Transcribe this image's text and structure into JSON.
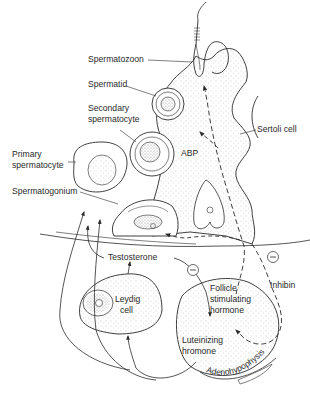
{
  "diagram": {
    "type": "biology-schematic",
    "colors": {
      "line": "#2a2a2a",
      "stipple": "#9a9a9a",
      "background": "#ffffff"
    },
    "labels": {
      "spermatozoon": "Spermatozoon",
      "spermatid": "Spermatid",
      "secondary_spermatocyte_1": "Secondary",
      "secondary_spermatocyte_2": "spermatocyte",
      "primary_spermatocyte_1": "Primary",
      "primary_spermatocyte_2": "spermatocyte",
      "spermatogonium": "Spermatogonium",
      "sertoli_cell": "Sertoli cell",
      "abp": "ABP",
      "testosterone": "Testosterone",
      "leydig_cell_1": "Leydig",
      "leydig_cell_2": "cell",
      "fsh_1": "Follicle",
      "fsh_2": "stimulating",
      "fsh_3": "hormone",
      "lh_1": "Luteinizing",
      "lh_2": "hromone",
      "inhibin": "Inhibin",
      "adenohypophysis": "Adenohypophysis",
      "inhibition_symbol": "−"
    },
    "arrows": [
      {
        "from": "Leydig cell",
        "to": "Testosterone",
        "style": "solid"
      },
      {
        "from": "Testosterone",
        "to": "Spermatogonium region",
        "style": "solid"
      },
      {
        "from": "Testosterone",
        "to": "Luteinizing hromone",
        "style": "solid",
        "effect": "inhibition"
      },
      {
        "from": "Luteinizing hromone",
        "to": "Leydig cell",
        "style": "solid"
      },
      {
        "from": "Follicle stimulating hormone",
        "to": "Sertoli cell",
        "style": "dashed"
      },
      {
        "from": "Sertoli cell",
        "to": "ABP",
        "style": "dashed"
      },
      {
        "from": "Sertoli cell",
        "to": "Inhibin",
        "style": "dashed",
        "effect": "inhibition"
      },
      {
        "from": "Inhibin",
        "to": "Follicle stimulating hormone",
        "style": "dashed"
      }
    ]
  }
}
